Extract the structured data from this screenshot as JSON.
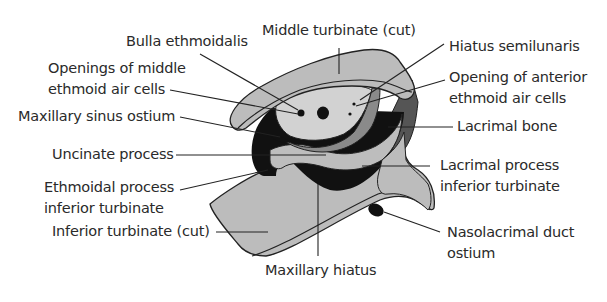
{
  "diagram": {
    "colors": {
      "bone_gray": "#b9b9b9",
      "light_gray": "#cfcfcf",
      "dark_gray": "#6a6a6a",
      "black": "#111111",
      "outline": "#222222",
      "text": "#2a2a2a"
    },
    "labels": {
      "middle_turbinate": "Middle turbinate (cut)",
      "bulla_ethmoidalis": "Bulla ethmoidalis",
      "hiatus_semilunaris": "Hiatus semilunaris",
      "openings_middle_1": "Openings of middle",
      "openings_middle_2": "ethmoid air cells",
      "opening_anterior_1": "Opening of anterior",
      "opening_anterior_2": "ethmoid air cells",
      "maxillary_sinus_ostium": "Maxillary sinus ostium",
      "lacrimal_bone": "Lacrimal bone",
      "uncinate_process": "Uncinate process",
      "lacrimal_process_1": "Lacrimal process",
      "lacrimal_process_2": "inferior turbinate",
      "ethmoidal_process_1": "Ethmoidal process",
      "ethmoidal_process_2": "inferior turbinate",
      "inferior_turbinate": "Inferior turbinate (cut)",
      "nasolacrimal_1": "Nasolacrimal duct",
      "nasolacrimal_2": "ostium",
      "maxillary_hiatus": "Maxillary hiatus"
    }
  }
}
